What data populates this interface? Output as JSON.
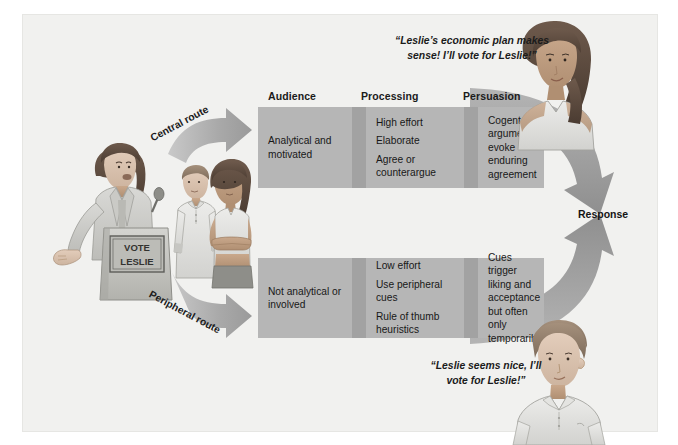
{
  "figure": {
    "title_hidden": "Elaboration Likelihood Model of Persuasion",
    "background_color": "#f1f1ef",
    "band_color": "#b6b6b6",
    "separator_color": "#a2a2a2",
    "arrow_color": "#9d9d9d",
    "text_color": "#181818"
  },
  "columns": [
    {
      "key": "audience",
      "label": "Audience"
    },
    {
      "key": "processing",
      "label": "Processing"
    },
    {
      "key": "persuasion",
      "label": "Persuasion"
    }
  ],
  "routes": [
    {
      "key": "central",
      "label": "Central route",
      "audience": [
        "Analytical and motivated"
      ],
      "processing": [
        "High effort",
        "Elaborate",
        "Agree or counterargue"
      ],
      "persuasion": [
        "Cogent arguments evoke enduring agreement"
      ],
      "quote": "“Leslie’s economic plan makes\nsense! I’ll vote for Leslie!”"
    },
    {
      "key": "peripheral",
      "label": "Peripheral route",
      "audience": [
        "Not analytical or involved"
      ],
      "processing": [
        "Low effort",
        "Use peripheral cues",
        "Rule of thumb heuristics"
      ],
      "persuasion": [
        "Cues trigger liking and acceptance but often only temporarily"
      ],
      "quote": "“Leslie seems nice, I’ll\nvote for Leslie!”"
    }
  ],
  "response": {
    "label": "Response"
  },
  "illustrations": {
    "speaker": {
      "name": "woman-speaking-at-podium",
      "podium_sign_line1": "VOTE",
      "podium_sign_line2": "LESLIE"
    },
    "audience_pair": {
      "name": "young-man-and-woman-listening"
    },
    "central_listener": {
      "name": "woman-with-long-dark-hair"
    },
    "peripheral_listener": {
      "name": "young-man-in-polo-shirt"
    }
  }
}
